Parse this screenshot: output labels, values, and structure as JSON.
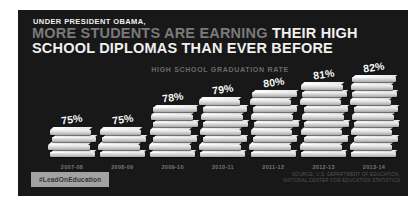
{
  "panel": {
    "kicker": "UNDER PRESIDENT OBAMA,",
    "headline_gray_part": "MORE STUDENTS ARE EARNING",
    "headline_white_part": " THEIR HIGH",
    "headline_line2": "SCHOOL DIPLOMAS THAN EVER BEFORE"
  },
  "chart_data": {
    "type": "bar",
    "title": "HIGH SCHOOL GRADUATION RATE",
    "categories": [
      "2007-08",
      "2008-09",
      "2009-10",
      "2010-11",
      "2011-12",
      "2012-13",
      "2013-14"
    ],
    "values": [
      75,
      75,
      78,
      79,
      80,
      81,
      82
    ],
    "unit": "%",
    "ylim": [
      71,
      83
    ],
    "xlabel": "",
    "ylabel": "",
    "grid": false,
    "legend": "none",
    "bar_style": "stacked-books-pictogram"
  },
  "footer": {
    "hashtag": "#LeadOnEducation",
    "source_line1": "SOURCE: U.S. DEPARTMENT OF EDUCATION,",
    "source_line2": "NATIONAL CENTER FOR EDUCATION STATISTICS"
  },
  "colors": {
    "panel_bg": "#181818",
    "headline_gray": "#7a7a7a",
    "headline_white": "#f0f0f0",
    "subtitle_gray": "#6a6a6a",
    "year_label": "#777777",
    "percent_label": "#fafafa",
    "badge_bg": "#a2a2a2",
    "badge_text": "#333333",
    "book_top": "#ffffff",
    "book_front": "#cfcfcf",
    "source_text": "#555555"
  }
}
